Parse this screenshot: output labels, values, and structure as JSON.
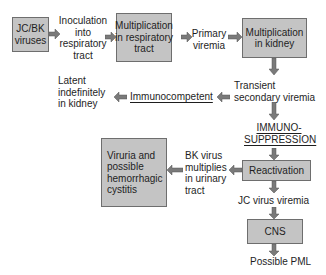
{
  "diagram": {
    "colors": {
      "box_fill": "#c4c4c4",
      "box_border": "#6e6e6e",
      "arrow_fill": "#7a7a7a",
      "text": "#1e1e1e"
    },
    "nodes": {
      "jcbk": "JC/BK\nviruses",
      "inoculation": "Inoculation\ninto\nrespiratory\ntract",
      "mult_resp": "Multiplication\nin respiratory\ntract",
      "primary_viremia": "Primary\nviremia",
      "mult_kidney": "Multiplication\nin kidney",
      "transient": "Transient\nsecondary viremia",
      "immunocompetent": "Immunocompetent",
      "latent": "Latent\nindefinitely\nin kidney",
      "immunosuppression": "IMMUNO-\nSUPPRESSION",
      "reactivation": "Reactivation",
      "bk_multiplies": "BK virus\nmultiplies\nin urinary\ntract",
      "viruria": "Viruria and\npossible\nhemorrhagic\ncystitis",
      "jc_viremia": "JC virus viremia",
      "cns": "CNS",
      "pml": "Possible PML"
    },
    "edges": [
      [
        "jcbk",
        "inoculation"
      ],
      [
        "inoculation",
        "mult_resp"
      ],
      [
        "mult_resp",
        "primary_viremia"
      ],
      [
        "primary_viremia",
        "mult_kidney"
      ],
      [
        "mult_kidney",
        "transient"
      ],
      [
        "transient",
        "immunocompetent"
      ],
      [
        "immunocompetent",
        "latent"
      ],
      [
        "transient",
        "immunosuppression"
      ],
      [
        "immunosuppression",
        "reactivation"
      ],
      [
        "reactivation",
        "bk_multiplies"
      ],
      [
        "bk_multiplies",
        "viruria"
      ],
      [
        "reactivation",
        "jc_viremia"
      ],
      [
        "jc_viremia",
        "cns"
      ],
      [
        "cns",
        "pml"
      ]
    ]
  }
}
